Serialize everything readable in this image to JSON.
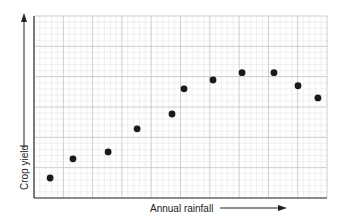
{
  "chart_data": {
    "type": "scatter",
    "title": "",
    "xlabel": "Annual rainfall",
    "ylabel": "Crop yield",
    "xlim": [
      0,
      10
    ],
    "ylim": [
      0,
      6
    ],
    "grid": true,
    "tick_labels": false,
    "points": [
      {
        "x": 0.55,
        "y": 0.66
      },
      {
        "x": 1.33,
        "y": 1.29
      },
      {
        "x": 2.53,
        "y": 1.52
      },
      {
        "x": 3.52,
        "y": 2.28
      },
      {
        "x": 4.71,
        "y": 2.77
      },
      {
        "x": 5.12,
        "y": 3.6
      },
      {
        "x": 6.11,
        "y": 3.89
      },
      {
        "x": 7.1,
        "y": 4.13
      },
      {
        "x": 8.19,
        "y": 4.13
      },
      {
        "x": 9.01,
        "y": 3.7
      },
      {
        "x": 9.69,
        "y": 3.3
      }
    ]
  },
  "colors": {
    "point": "#1a1a1a",
    "axis": "#333333",
    "major_grid": "#c8c8c8",
    "minor_grid": "#e6e6e6"
  }
}
